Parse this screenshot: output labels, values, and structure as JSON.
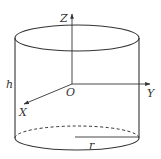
{
  "diagram": {
    "type": "cylinder-with-3d-axes",
    "labels": {
      "z_axis": "Z",
      "y_axis": "Y",
      "x_axis": "X",
      "origin": "O",
      "height": "h",
      "radius": "r"
    },
    "colors": {
      "line": "#333333",
      "background": "#ffffff"
    }
  }
}
